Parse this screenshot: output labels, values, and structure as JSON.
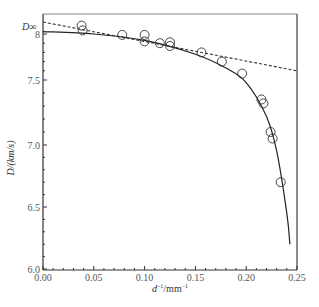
{
  "chart_data": {
    "type": "scatter",
    "title": "",
    "xlabel": "d⁻¹/mm⁻¹",
    "ylabel": "D/(km/s)",
    "xlim": [
      0.0,
      0.25
    ],
    "ylim": [
      6.0,
      8.0
    ],
    "x_ticks": [
      "0.00",
      "0.05",
      "0.10",
      "0.15",
      "0.20",
      "0.25"
    ],
    "y_ticks": [
      "6.0",
      "6.5",
      "7.0",
      "7.5",
      "8"
    ],
    "y_extra_label": "D∞",
    "grid": false,
    "legend": null,
    "series": [
      {
        "name": "experimental data",
        "kind": "scatter",
        "marker": "open-circle",
        "points": [
          {
            "x": 0.038,
            "y": 8.07
          },
          {
            "x": 0.039,
            "y": 8.03
          },
          {
            "x": 0.078,
            "y": 7.99
          },
          {
            "x": 0.1,
            "y": 7.99
          },
          {
            "x": 0.1,
            "y": 7.92
          },
          {
            "x": 0.115,
            "y": 7.9
          },
          {
            "x": 0.125,
            "y": 7.91
          },
          {
            "x": 0.125,
            "y": 7.87
          },
          {
            "x": 0.156,
            "y": 7.8
          },
          {
            "x": 0.176,
            "y": 7.7
          },
          {
            "x": 0.196,
            "y": 7.57
          },
          {
            "x": 0.215,
            "y": 7.35
          },
          {
            "x": 0.217,
            "y": 7.32
          },
          {
            "x": 0.224,
            "y": 7.1
          },
          {
            "x": 0.226,
            "y": 7.05
          },
          {
            "x": 0.234,
            "y": 6.7
          }
        ]
      },
      {
        "name": "fitted curve",
        "kind": "line",
        "style": "solid",
        "points": [
          {
            "x": 0.0,
            "y": 8.02
          },
          {
            "x": 0.05,
            "y": 8.0
          },
          {
            "x": 0.1,
            "y": 7.93
          },
          {
            "x": 0.15,
            "y": 7.78
          },
          {
            "x": 0.18,
            "y": 7.63
          },
          {
            "x": 0.2,
            "y": 7.48
          },
          {
            "x": 0.22,
            "y": 7.22
          },
          {
            "x": 0.23,
            "y": 6.95
          },
          {
            "x": 0.24,
            "y": 6.45
          },
          {
            "x": 0.243,
            "y": 6.2
          }
        ]
      },
      {
        "name": "linear extrapolation",
        "kind": "line",
        "style": "dashed",
        "points": [
          {
            "x": 0.0,
            "y": 8.1
          },
          {
            "x": 0.25,
            "y": 7.6
          }
        ]
      }
    ]
  },
  "axes": {
    "x_title_italic": "d",
    "x_title_sup": "−1",
    "x_title_unit": "/mm",
    "x_title_unit_sup": "−1",
    "y_title": "D/(km/s)",
    "y_extra_label": "D∞"
  },
  "caption": ""
}
